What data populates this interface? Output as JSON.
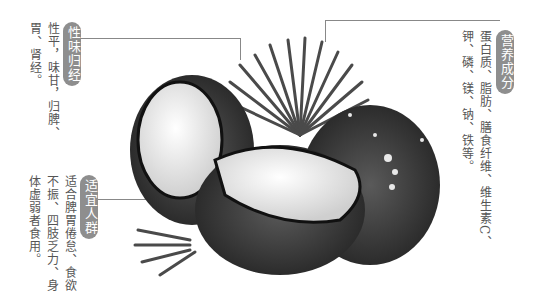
{
  "sections": {
    "nature": {
      "label": "性味归经",
      "lines": [
        "性平，味甘，归脾、",
        "胃、肾经。"
      ]
    },
    "nutrition": {
      "label": "营养成分",
      "lines": [
        "蛋白质、脂肪、膳食纤维、维生素C、",
        "钾、磷、镁、钠、铁等。"
      ]
    },
    "suitable": {
      "label": "适宜人群",
      "lines": [
        "适合脾胃倦怠、食欲",
        "不振、四肢乏力、身",
        "体虚弱者食用。"
      ]
    }
  },
  "image": {
    "subject": "coconut-illustration"
  }
}
